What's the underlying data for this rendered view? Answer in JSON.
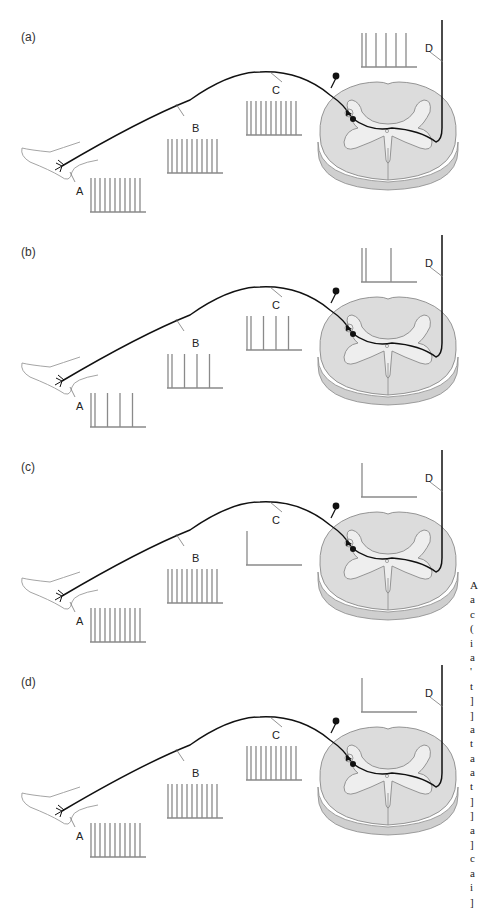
{
  "figure": {
    "colors": {
      "nerve": "#111111",
      "trace": "#8a8a8a",
      "cord_white_matter": "#dcdcdc",
      "cord_grey_matter": "#eeeeee",
      "cord_outline": "#8a8a8a",
      "foot_outline": "#9a9a9a"
    },
    "panels": [
      {
        "id": "a",
        "label": "(a)",
        "points": {
          "A": "A",
          "B": "B",
          "C": "C",
          "D": "D"
        },
        "spikes": {
          "A": 10,
          "B": 10,
          "C": 10,
          "D": 5
        }
      },
      {
        "id": "b",
        "label": "(b)",
        "points": {
          "A": "A",
          "B": "B",
          "C": "C",
          "D": "D"
        },
        "spikes": {
          "A": 4,
          "B": 4,
          "C": 4,
          "D": 2
        }
      },
      {
        "id": "c",
        "label": "(c)",
        "points": {
          "A": "A",
          "B": "B",
          "C": "C",
          "D": "D"
        },
        "spikes": {
          "A": 10,
          "B": 10,
          "C": 0,
          "D": 0
        }
      },
      {
        "id": "d",
        "label": "(d)",
        "points": {
          "A": "A",
          "B": "B",
          "C": "C",
          "D": "D"
        },
        "spikes": {
          "A": 10,
          "B": 10,
          "C": 10,
          "D": 0
        }
      }
    ],
    "clipped_side_text": [
      "A",
      "a",
      "c",
      "(",
      "i",
      "a",
      "'",
      "t",
      "]",
      "]",
      "a",
      "t",
      "a",
      "a",
      "t",
      "]",
      "]",
      "a",
      "]",
      "c",
      "a",
      "i",
      "]"
    ]
  }
}
